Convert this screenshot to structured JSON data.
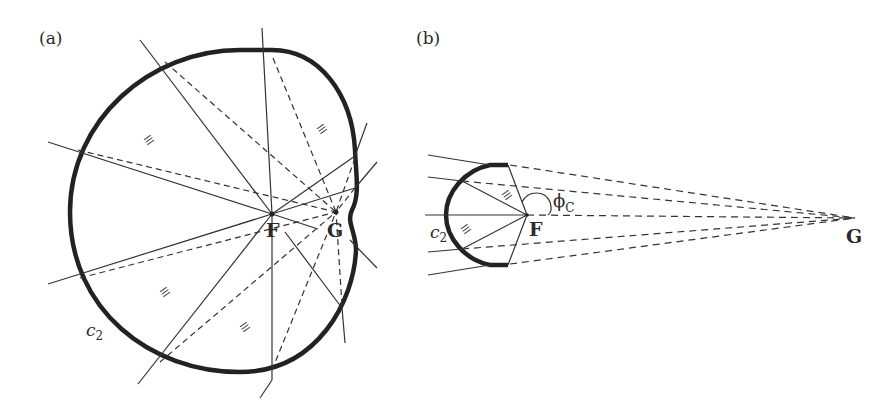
{
  "figure": {
    "panels": [
      {
        "id": "a",
        "label": "(a)",
        "points": {
          "F": "F",
          "G": "G"
        },
        "curve_label": {
          "main": "c",
          "sub": "2"
        },
        "equal_angle_mark": "≡"
      },
      {
        "id": "b",
        "label": "(b)",
        "points": {
          "F": "F",
          "G": "G"
        },
        "curve_label": {
          "main": "c",
          "sub": "2"
        },
        "angle_label": {
          "main": "ϕ",
          "sub": "C"
        },
        "equal_angle_mark": "≡"
      }
    ],
    "colors": {
      "curve": "#222222",
      "line": "#333333",
      "text": "#2a2a2a"
    }
  }
}
